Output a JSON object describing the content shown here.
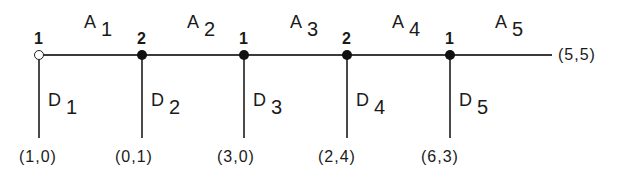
{
  "nodes": [
    {
      "label": "1",
      "type": "open"
    },
    {
      "label": "2",
      "type": "filled"
    },
    {
      "label": "1",
      "type": "filled"
    },
    {
      "label": "2",
      "type": "filled"
    },
    {
      "label": "1",
      "type": "filled"
    }
  ],
  "arcs": [
    {
      "letter": "A",
      "sub": "1"
    },
    {
      "letter": "A",
      "sub": "2"
    },
    {
      "letter": "A",
      "sub": "3"
    },
    {
      "letter": "A",
      "sub": "4"
    },
    {
      "letter": "A",
      "sub": "5"
    }
  ],
  "branches": [
    {
      "letter": "D",
      "sub": "1",
      "payoff": "(1,0)"
    },
    {
      "letter": "D",
      "sub": "2",
      "payoff": "(0,1)"
    },
    {
      "letter": "D",
      "sub": "3",
      "payoff": "(3,0)"
    },
    {
      "letter": "D",
      "sub": "4",
      "payoff": "(2,4)"
    },
    {
      "letter": "D",
      "sub": "5",
      "payoff": "(6,3)"
    }
  ],
  "terminal_payoff": "(5,5)"
}
